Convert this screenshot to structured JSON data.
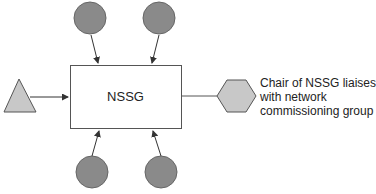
{
  "diagram": {
    "central_box": {
      "label": "NSSG"
    },
    "note": {
      "lines": [
        "Chair of NSSG liaises",
        "with network",
        "commissioning group"
      ]
    },
    "nodes": {
      "top_left_circle": "circle",
      "top_right_circle": "circle",
      "bottom_left_circle": "circle",
      "bottom_right_circle": "circle",
      "left_triangle": "triangle",
      "right_hexagon": "hexagon"
    },
    "colors": {
      "circle_fill": "#8a8a8a",
      "shape_fill": "#c8c8c8",
      "stroke": "#555555",
      "box_fill": "#ffffff"
    }
  }
}
